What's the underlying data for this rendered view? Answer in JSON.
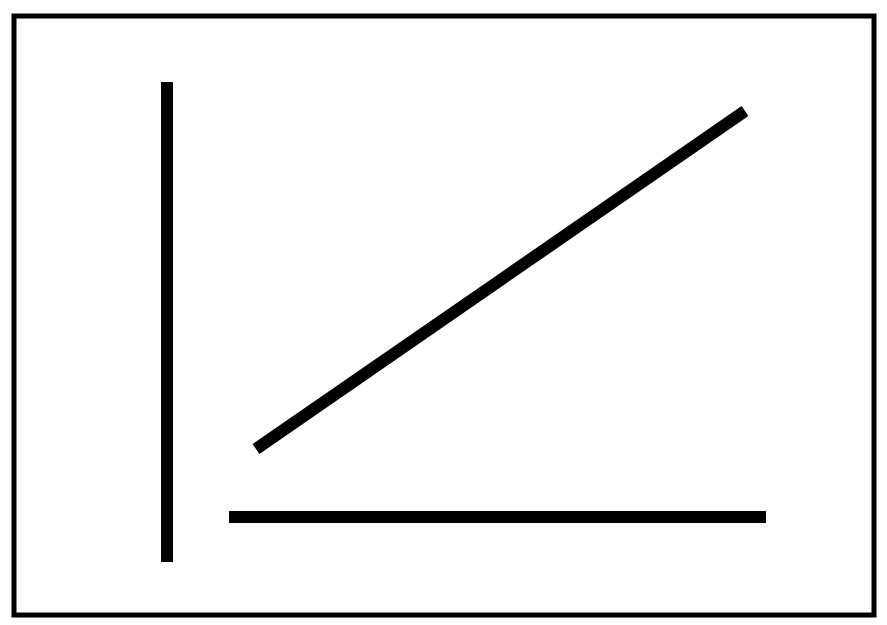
{
  "canvas": {
    "width": 887,
    "height": 625,
    "background_color": "#ffffff",
    "ink_color": "#000000"
  },
  "figure": {
    "frame": {
      "name": "border-frame",
      "shape": "rectangle",
      "x": 14,
      "y": 16,
      "width": 860,
      "height": 599,
      "stroke_width": 5,
      "stroke_color": "#000000",
      "fill": "none"
    },
    "strokes": [
      {
        "name": "vertical-line",
        "shape": "line",
        "x1": 167,
        "y1": 82,
        "x2": 167,
        "y2": 562,
        "stroke_width": 12,
        "stroke_color": "#000000",
        "linecap": "butt",
        "orientation": "vertical",
        "length": 480
      },
      {
        "name": "diagonal-line",
        "shape": "line",
        "x1": 256,
        "y1": 449,
        "x2": 745,
        "y2": 111,
        "stroke_width": 12,
        "stroke_color": "#000000",
        "linecap": "butt",
        "orientation": "diagonal-rising",
        "angle_degrees": -34.6,
        "length": 594
      },
      {
        "name": "horizontal-line",
        "shape": "line",
        "x1": 229,
        "y1": 517,
        "x2": 766,
        "y2": 517,
        "stroke_width": 12,
        "stroke_color": "#000000",
        "linecap": "butt",
        "orientation": "horizontal",
        "length": 537
      }
    ]
  }
}
